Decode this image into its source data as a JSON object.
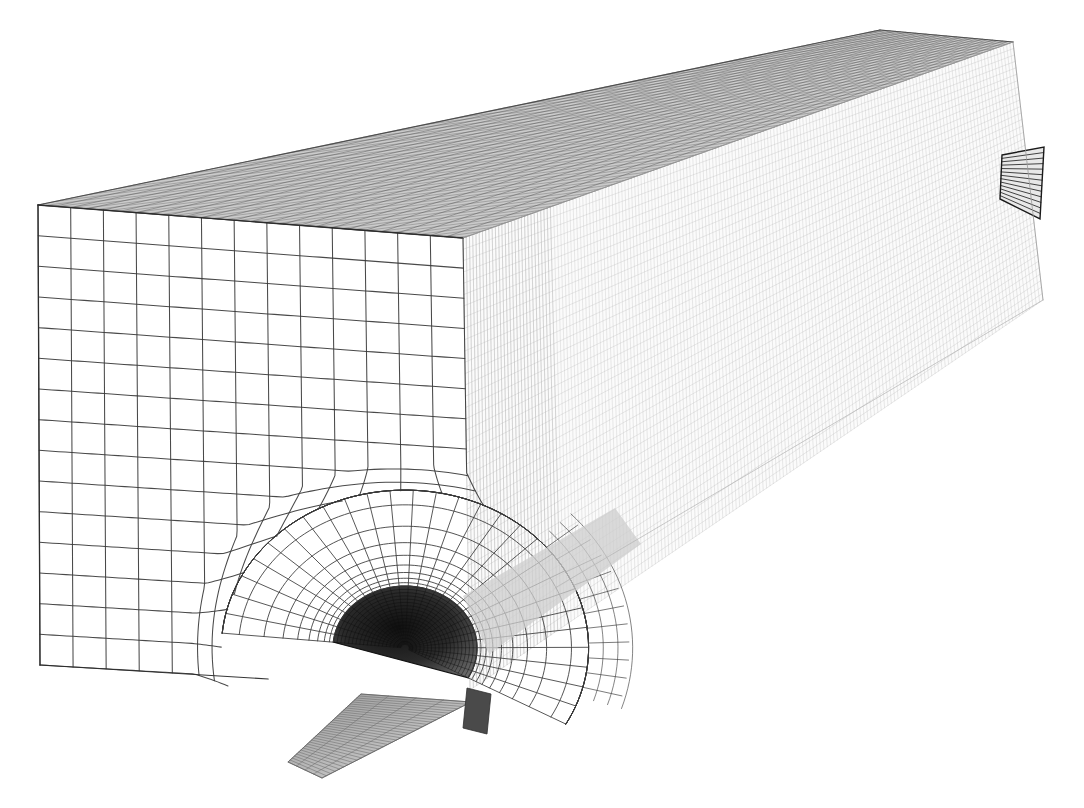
{
  "figure": {
    "kind": "engineering-mesh-render",
    "background_color": "#ffffff",
    "canvas": {
      "width": 1084,
      "height": 808
    },
    "has_text_labels": false,
    "has_axes": false,
    "has_legend": false,
    "caption": ""
  },
  "render": {
    "style": "scanned line drawing, black wireframe on white paper",
    "line_color_front": "#3a3a3a",
    "line_color_top": "#555555",
    "line_color_side": "#b9b9b9",
    "line_color_dark_cavity": "#1d1d1d",
    "line_color_fin": "#8a8a8a",
    "paper_color": "#ffffff",
    "front_line_width": 1.05,
    "top_line_width": 0.55,
    "side_line_width": 0.45
  },
  "geometry": {
    "description": "Perspective view of a long rectangular prism. Near (left) end shows the coarse front cross-section mesh; the long right-going body shows the finely meshed top and side surfaces.",
    "corners": {
      "front_top_left": [
        38,
        205
      ],
      "front_top_right": [
        463,
        238
      ],
      "front_bottom_left": [
        40,
        665
      ],
      "front_bottom_right": [
        470,
        690
      ],
      "back_top_right": [
        1013,
        42
      ],
      "back_bottom_right": [
        1043,
        300
      ],
      "top_far_left": [
        38,
        205
      ],
      "top_near_apex": [
        880,
        30
      ]
    },
    "front_face": {
      "name": "near cross-section face",
      "mesh_type": "unstructured graded quadrilateral",
      "approx_columns": 13,
      "approx_rows": 15,
      "shading": "white interior, dark outlines"
    },
    "top_face": {
      "name": "upper surface",
      "mesh_type": "structured fine quadrilateral",
      "approx_columns": 150,
      "approx_rows": 26,
      "shading": "dense, reads as dark grey hatch"
    },
    "side_face": {
      "name": "lateral surface",
      "mesh_type": "structured very fine quadrilateral",
      "approx_columns": 170,
      "approx_rows": 40,
      "shading": "very light grey, faint"
    }
  },
  "features": [
    {
      "id": "notch-near",
      "name": "semicircular notch (near end)",
      "center": [
        405,
        648
      ],
      "radius": 72,
      "refinement": "radial fan of graded quads, ~28 circumferential by ~14 radial divisions",
      "appearance": "dark elliptical cavity with dense concentric banding"
    },
    {
      "id": "fin-protrusion",
      "name": "lower fin protrusion",
      "tip": [
        288,
        762
      ],
      "appearance": "grey ribbed strip extending below and left of the notch"
    },
    {
      "id": "notch-far",
      "name": "notch cross-section (far end)",
      "center": [
        1022,
        185
      ],
      "appearance": "small dark wedge with horizontal hatch lines at the far right edge"
    }
  ],
  "mesh_stats": {
    "front_face_coarse_cells": 195,
    "notch_fan_rings": 14,
    "notch_fan_sectors": 28,
    "top_face_cells_u": 150,
    "top_face_cells_v": 26,
    "side_face_cells_u": 170,
    "side_face_cells_v": 40
  }
}
